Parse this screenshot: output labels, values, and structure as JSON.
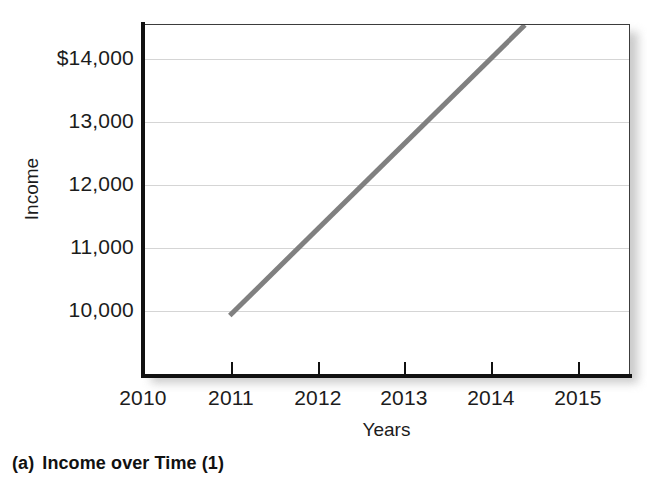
{
  "figure": {
    "caption_tag": "(a)",
    "caption_text": "Income over Time (1)"
  },
  "chart_data": {
    "type": "line",
    "title": "Income over Time (1)",
    "xlabel": "Years",
    "ylabel": "Income",
    "x": [
      2011,
      2014.4
    ],
    "series": [
      {
        "name": "Income",
        "values": [
          10300,
          14450
        ],
        "color": "#808080"
      }
    ],
    "xlim": [
      2010,
      2015.6
    ],
    "ylim": [
      9450,
      14450
    ],
    "xticks": [
      2010,
      2011,
      2012,
      2013,
      2014,
      2015
    ],
    "xticklabels": [
      "2010",
      "2011",
      "2012",
      "2013",
      "2014",
      "2015"
    ],
    "yticks": [
      10000,
      11000,
      12000,
      13000,
      14000
    ],
    "yticklabels": [
      "10,000",
      "11,000",
      "12,000",
      "13,000",
      "$14,000"
    ],
    "grid": true,
    "grid_axis": "y",
    "grid_color": "#d5d5d5",
    "legend": "none",
    "line_width": 5,
    "annotations": []
  },
  "axes": {
    "y_title": "Income",
    "x_title": "Years",
    "y_tick_labels": [
      "$14,000",
      "13,000",
      "12,000",
      "11,000",
      "10,000"
    ],
    "x_tick_labels": [
      "2010",
      "2011",
      "2012",
      "2013",
      "2014",
      "2015"
    ]
  }
}
